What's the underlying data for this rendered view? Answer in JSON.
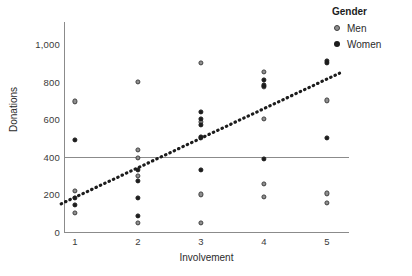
{
  "chart_data": {
    "type": "scatter",
    "title": "",
    "xlabel": "Involvement",
    "ylabel": "Donations",
    "xlim": [
      0.7,
      5.4
    ],
    "ylim": [
      0,
      1080
    ],
    "grid": false,
    "legend": {
      "title": "Gender",
      "position": "top-right",
      "entries": [
        {
          "name": "Men",
          "color": "#8e8e8e",
          "marker": "open-gray-circle"
        },
        {
          "name": "Women",
          "color": "#1c1c1c",
          "marker": "filled-dark-circle"
        }
      ]
    },
    "xticks": [
      1,
      2,
      3,
      4,
      5
    ],
    "xticklabels": [
      "1",
      "2",
      "3",
      "4",
      "5"
    ],
    "yticks": [
      0,
      200,
      400,
      600,
      800,
      1000
    ],
    "yticklabels": [
      "0",
      "200",
      "400",
      "600",
      "800",
      "1,000"
    ],
    "reference_lines": [
      {
        "orientation": "horizontal",
        "value": 400,
        "color": "#8b8b8b"
      }
    ],
    "trend_line": {
      "style": "dotted",
      "color": "#1c1c1c",
      "x_start": 0.78,
      "y_start": 150,
      "x_end": 5.2,
      "y_end": 845
    },
    "series": [
      {
        "name": "Men",
        "color": "#8e8e8e",
        "points": [
          {
            "x": 1,
            "y": 695
          },
          {
            "x": 1,
            "y": 220
          },
          {
            "x": 1,
            "y": 100
          },
          {
            "x": 2,
            "y": 800
          },
          {
            "x": 2,
            "y": 435
          },
          {
            "x": 2,
            "y": 395
          },
          {
            "x": 2,
            "y": 300
          },
          {
            "x": 2,
            "y": 50
          },
          {
            "x": 3,
            "y": 900
          },
          {
            "x": 3,
            "y": 585
          },
          {
            "x": 3,
            "y": 500
          },
          {
            "x": 3,
            "y": 200
          },
          {
            "x": 3,
            "y": 50
          },
          {
            "x": 4,
            "y": 850
          },
          {
            "x": 4,
            "y": 770
          },
          {
            "x": 4,
            "y": 600
          },
          {
            "x": 4,
            "y": 255
          },
          {
            "x": 4,
            "y": 185
          },
          {
            "x": 5,
            "y": 700
          },
          {
            "x": 5,
            "y": 205
          },
          {
            "x": 5,
            "y": 155
          }
        ]
      },
      {
        "name": "Women",
        "color": "#1c1c1c",
        "points": [
          {
            "x": 1,
            "y": 490
          },
          {
            "x": 1,
            "y": 180
          },
          {
            "x": 1,
            "y": 145
          },
          {
            "x": 2,
            "y": 330
          },
          {
            "x": 2,
            "y": 270
          },
          {
            "x": 2,
            "y": 180
          },
          {
            "x": 2,
            "y": 85
          },
          {
            "x": 3,
            "y": 640
          },
          {
            "x": 3,
            "y": 600
          },
          {
            "x": 3,
            "y": 570
          },
          {
            "x": 3,
            "y": 505
          },
          {
            "x": 3,
            "y": 330
          },
          {
            "x": 4,
            "y": 810
          },
          {
            "x": 4,
            "y": 780
          },
          {
            "x": 4,
            "y": 390
          },
          {
            "x": 5,
            "y": 910
          },
          {
            "x": 5,
            "y": 900
          },
          {
            "x": 5,
            "y": 500
          }
        ]
      }
    ]
  }
}
